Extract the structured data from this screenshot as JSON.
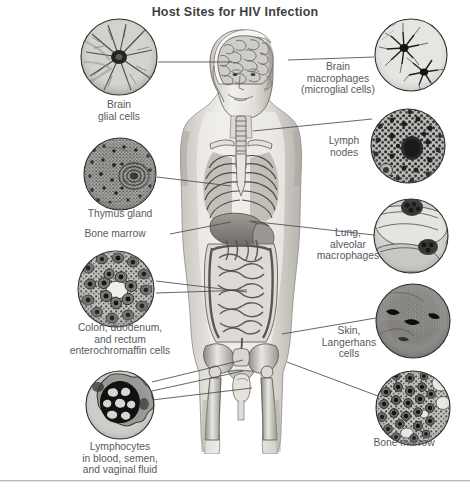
{
  "figure": {
    "title": "Host Sites for HIV Infection",
    "type": "anatomical-diagram",
    "background_color": "#ffffff",
    "line_color": "#4a4a4a",
    "text_color": "#555a5e",
    "title_color": "#3f3f3f"
  },
  "callouts": [
    {
      "id": "brain-glial-cells",
      "label": "Brain\nglial cells",
      "side": "left",
      "micrograph": "branched glial cell with radiating processes",
      "circle": {
        "x": 80,
        "y": 18,
        "d": 78
      },
      "caption": {
        "x": 62,
        "y": 99,
        "w": 114
      },
      "leader": {
        "x1": 158,
        "y1": 62,
        "x2": 232,
        "y2": 62
      }
    },
    {
      "id": "brain-macrophages",
      "label": "Brain\nmacrophages\n(microglial cells)",
      "side": "right",
      "micrograph": "dark stellate microglial cells on pale field",
      "circle": {
        "x": 374,
        "y": 18,
        "d": 74
      },
      "caption": {
        "x": 296,
        "y": 61,
        "w": 84
      },
      "leader": {
        "x1": 288,
        "y1": 60,
        "x2": 374,
        "y2": 57
      }
    },
    {
      "id": "lymph-nodes",
      "label": "Lymph\nnodes",
      "side": "right",
      "micrograph": "dense dark lymphoid cells with large germinal center",
      "circle": {
        "x": 370,
        "y": 108,
        "d": 76
      },
      "caption": {
        "x": 318,
        "y": 135,
        "w": 52
      },
      "leader": {
        "x1": 253,
        "y1": 131,
        "x2": 372,
        "y2": 119
      }
    },
    {
      "id": "thymus-gland",
      "label": "Thymus gland",
      "side": "left",
      "micrograph": "thymic lobule with Hassall's corpuscle",
      "circle": {
        "x": 83,
        "y": 137,
        "d": 74
      },
      "caption": {
        "x": 57,
        "y": 208,
        "w": 126
      },
      "leader": {
        "x1": 157,
        "y1": 177,
        "x2": 231,
        "y2": 186
      }
    },
    {
      "id": "bone-marrow-left",
      "label": "Bone marrow",
      "side": "left",
      "micrograph": null,
      "circle": null,
      "caption": {
        "x": 60,
        "y": 228,
        "w": 110
      },
      "leader": {
        "x1": 170,
        "y1": 234,
        "x2": 231,
        "y2": 222
      }
    },
    {
      "id": "lung-alveolar-macrophages",
      "label": "Lung,\nalveolar\nmacrophages",
      "side": "right",
      "micrograph": "alveolar wall with macrophages in air space",
      "circle": {
        "x": 373,
        "y": 198,
        "d": 76
      },
      "caption": {
        "x": 316,
        "y": 227,
        "w": 64
      },
      "leader": {
        "x1": 249,
        "y1": 221,
        "x2": 374,
        "y2": 235
      }
    },
    {
      "id": "colon-duodenum-rectum",
      "label": "Colon, duodenum,\nand rectum\nenterochromaffin cells",
      "side": "left",
      "micrograph": "intestinal crypt cross-section with enterochromaffin cells",
      "circle": {
        "x": 78,
        "y": 251,
        "d": 77
      },
      "caption": {
        "x": 44,
        "y": 322,
        "w": 152
      },
      "leader": {
        "x1": 156,
        "y1": 281,
        "x2": 247,
        "y2": 292
      },
      "leader2": {
        "x1": 156,
        "y1": 293,
        "x2": 247,
        "y2": 290
      }
    },
    {
      "id": "skin-langerhans-cells",
      "label": "Skin,\nLangerhans\ncells",
      "side": "right",
      "micrograph": "epidermis section showing Langerhans cells",
      "circle": {
        "x": 375,
        "y": 283,
        "d": 76
      },
      "caption": {
        "x": 316,
        "y": 325,
        "w": 66
      },
      "leader": {
        "x1": 282,
        "y1": 334,
        "x2": 376,
        "y2": 318
      }
    },
    {
      "id": "bone-marrow-right",
      "label": "Bone marrow",
      "side": "right",
      "micrograph": "marrow with packed hematopoietic cells and fat vacuoles",
      "circle": {
        "x": 375,
        "y": 370,
        "d": 76
      },
      "caption": {
        "x": 348,
        "y": 437,
        "w": 112
      },
      "leader": {
        "x1": 287,
        "y1": 362,
        "x2": 378,
        "y2": 396
      }
    },
    {
      "id": "lymphocytes",
      "label": "Lymphocytes\nin blood, semen,\nand vaginal fluid",
      "side": "left",
      "micrograph": "single lymphocyte with large lobed dark nucleus",
      "circle": {
        "x": 85,
        "y": 370,
        "d": 70
      },
      "caption": {
        "x": 60,
        "y": 441,
        "w": 120
      },
      "leader": {
        "x1": 152,
        "y1": 382,
        "x2": 243,
        "y2": 362
      },
      "leader2": {
        "x1": 152,
        "y1": 392,
        "x2": 243,
        "y2": 372
      },
      "leader3": {
        "x1": 152,
        "y1": 400,
        "x2": 250,
        "y2": 386
      }
    }
  ],
  "body_regions": [
    "head and brain",
    "neck and trachea",
    "thorax with ribcage and lungs",
    "liver and diaphragm",
    "small and large intestine",
    "pelvis and femurs",
    "genitals"
  ]
}
